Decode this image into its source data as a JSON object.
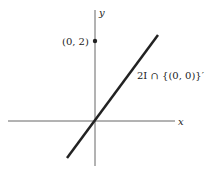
{
  "axes": {
    "x_label": "x",
    "y_label": "y"
  },
  "point": {
    "label": "(0, 2)"
  },
  "line": {
    "label": "2I ∩ {(0, 0)}′"
  },
  "colors": {
    "ink": "#222222",
    "background": "#ffffff"
  }
}
